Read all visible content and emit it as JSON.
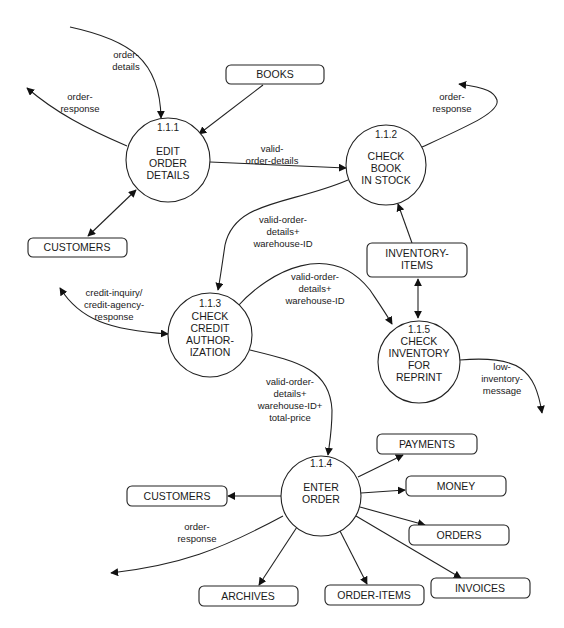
{
  "diagram": {
    "type": "data-flow-diagram",
    "processes": [
      {
        "id": "1.1.1",
        "lines": [
          "EDIT",
          "ORDER",
          "DETAILS"
        ]
      },
      {
        "id": "1.1.2",
        "lines": [
          "CHECK",
          "BOOK",
          "IN STOCK"
        ]
      },
      {
        "id": "1.1.3",
        "lines": [
          "CHECK",
          "CREDIT",
          "AUTHOR-",
          "IZATION"
        ]
      },
      {
        "id": "1.1.4",
        "lines": [
          "ENTER",
          "ORDER"
        ]
      },
      {
        "id": "1.1.5",
        "lines": [
          "CHECK",
          "INVENTORY",
          "FOR",
          "REPRINT"
        ]
      }
    ],
    "stores": {
      "books": "BOOKS",
      "customers_top": "CUSTOMERS",
      "inventory_items": [
        "INVENTORY-",
        "ITEMS"
      ],
      "payments": "PAYMENTS",
      "customers_bottom": "CUSTOMERS",
      "money": "MONEY",
      "orders": "ORDERS",
      "archives": "ARCHIVES",
      "order_items": "ORDER-ITEMS",
      "invoices": "INVOICES"
    },
    "flows": {
      "order_details_in": [
        "order-",
        "details"
      ],
      "order_response_111": [
        "order-",
        "response"
      ],
      "valid_order_details": [
        "valid-",
        "order-details"
      ],
      "order_response_112": [
        "order-",
        "response"
      ],
      "to_113": [
        "valid-order-",
        "details+",
        "warehouse-ID"
      ],
      "to_115": [
        "valid-order-",
        "details+",
        "warehouse-ID"
      ],
      "credit": [
        "credit-inquiry/",
        "credit-agency-",
        "response"
      ],
      "low_inventory": [
        "low-",
        "inventory-",
        "message"
      ],
      "to_114": [
        "valid-order-",
        "details+",
        "warehouse-ID+",
        "total-price"
      ],
      "order_response_114": [
        "order-",
        "response"
      ]
    }
  }
}
